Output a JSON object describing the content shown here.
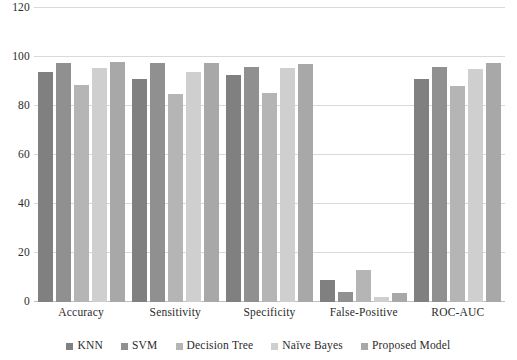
{
  "chart_data": {
    "type": "bar",
    "title": "",
    "xlabel": "",
    "ylabel": "",
    "ylim": [
      0,
      120
    ],
    "yticks": [
      0,
      20,
      40,
      60,
      80,
      100,
      120
    ],
    "ytick_labels": [
      "0",
      "20",
      "40",
      "60",
      "80",
      "100",
      "120"
    ],
    "grid": true,
    "legend_position": "bottom",
    "categories": [
      "Accuracy",
      "Sensitivity",
      "Specificity",
      "False-Positive",
      "ROC-AUC"
    ],
    "series": [
      {
        "name": "KNN",
        "color": "#808080",
        "values": [
          94.0,
          91.0,
          92.5,
          9.0,
          91.0
        ]
      },
      {
        "name": "SVM",
        "color": "#909090",
        "values": [
          97.5,
          97.5,
          96.0,
          4.0,
          96.0
        ]
      },
      {
        "name": "Decision Tree",
        "color": "#b5b5b5",
        "values": [
          88.5,
          85.0,
          85.5,
          13.0,
          88.0
        ]
      },
      {
        "name": "Naïve Bayes",
        "color": "#cfcfcf",
        "values": [
          95.5,
          94.0,
          95.5,
          2.0,
          95.0
        ]
      },
      {
        "name": "Proposed Model",
        "color": "#a8a8a8",
        "values": [
          98.0,
          97.5,
          97.0,
          3.5,
          97.5
        ]
      }
    ]
  },
  "colors": {
    "gridline": "#d9d9d9",
    "baseline": "#bfbfbf",
    "text": "#2b2b2b",
    "background": "#ffffff"
  }
}
